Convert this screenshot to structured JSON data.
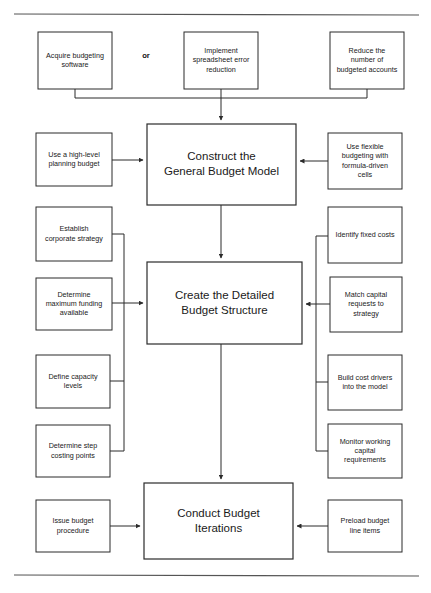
{
  "diagram": {
    "type": "flowchart",
    "connector_labels": {
      "or": "or"
    },
    "main_steps": [
      {
        "id": "construct",
        "lines": [
          "Construct the",
          "General Budget Model"
        ],
        "x": 147,
        "y": 124,
        "w": 149,
        "h": 81
      },
      {
        "id": "create",
        "lines": [
          "Create the Detailed",
          "Budget Structure"
        ],
        "x": 147,
        "y": 262,
        "w": 155,
        "h": 82
      },
      {
        "id": "conduct",
        "lines": [
          "Conduct Budget",
          "Iterations"
        ],
        "x": 144,
        "y": 483,
        "w": 149,
        "h": 76
      }
    ],
    "top_inputs": [
      {
        "id": "acquire-budgeting-software",
        "lines": [
          "Acquire budgeting",
          "software"
        ],
        "x": 38,
        "y": 32,
        "w": 74,
        "h": 57
      },
      {
        "id": "implement-spreadsheet-error-reduction",
        "lines": [
          "Implement",
          "spreadsheet error",
          "reduction"
        ],
        "x": 184,
        "y": 32,
        "w": 74,
        "h": 57
      },
      {
        "id": "reduce-number-of-budgeted-accounts",
        "lines": [
          "Reduce the",
          "number of",
          "budgeted accounts"
        ],
        "x": 330,
        "y": 32,
        "w": 74,
        "h": 57
      }
    ],
    "left_inputs": [
      {
        "id": "use-high-level-planning-budget",
        "lines": [
          "Use a high-level",
          "planning budget"
        ],
        "x": 36,
        "y": 133,
        "w": 76,
        "h": 53
      },
      {
        "id": "establish-corporate-strategy",
        "lines": [
          "Establish",
          "corporate strategy"
        ],
        "x": 36,
        "y": 207,
        "w": 76,
        "h": 54
      },
      {
        "id": "determine-maximum-funding-available",
        "lines": [
          "Determine",
          "maximum funding",
          "available"
        ],
        "x": 36,
        "y": 278,
        "w": 76,
        "h": 52
      },
      {
        "id": "define-capacity-levels",
        "lines": [
          "Define capacity",
          "levels"
        ],
        "x": 36,
        "y": 355,
        "w": 74,
        "h": 53
      },
      {
        "id": "determine-step-costing-points",
        "lines": [
          "Determine step",
          "costing points"
        ],
        "x": 36,
        "y": 425,
        "w": 74,
        "h": 52
      },
      {
        "id": "issue-budget-procedure",
        "lines": [
          "Issue budget",
          "procedure"
        ],
        "x": 36,
        "y": 500,
        "w": 74,
        "h": 52
      }
    ],
    "right_inputs": [
      {
        "id": "use-flexible-budgeting-formula-driven-cells",
        "lines": [
          "Use flexible",
          "budgeting with",
          "formula-driven",
          "cells"
        ],
        "x": 328,
        "y": 133,
        "w": 74,
        "h": 56
      },
      {
        "id": "identify-fixed-costs",
        "lines": [
          "Identify fixed costs"
        ],
        "x": 328,
        "y": 207,
        "w": 74,
        "h": 56
      },
      {
        "id": "match-capital-requests-to-strategy",
        "lines": [
          "Match capital",
          "requests to",
          "strategy"
        ],
        "x": 330,
        "y": 277,
        "w": 72,
        "h": 55
      },
      {
        "id": "build-cost-drivers-into-the-model",
        "lines": [
          "Build cost drivers",
          "into the model"
        ],
        "x": 328,
        "y": 355,
        "w": 74,
        "h": 55
      },
      {
        "id": "monitor-working-capital-requirements",
        "lines": [
          "Monitor working",
          "capital",
          "requirements"
        ],
        "x": 328,
        "y": 424,
        "w": 74,
        "h": 54
      },
      {
        "id": "preload-budget-line-items",
        "lines": [
          "Preload budget",
          "line items"
        ],
        "x": 328,
        "y": 500,
        "w": 74,
        "h": 52
      }
    ],
    "colors": {
      "stroke": "#2b2b2b",
      "background": "#ffffff",
      "rule": "#555555",
      "text": "#1a1a1a"
    }
  }
}
